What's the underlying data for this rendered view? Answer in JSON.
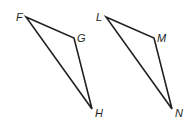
{
  "diagram": {
    "type": "geometry-triangles",
    "stroke_color": "#231f20",
    "background": "#ffffff",
    "triangles": [
      {
        "name": "FGH",
        "vertices": [
          {
            "label": "F",
            "x": 26,
            "y": 17,
            "lx": 16,
            "ly": 21
          },
          {
            "label": "G",
            "x": 74,
            "y": 38,
            "lx": 77,
            "ly": 42
          },
          {
            "label": "H",
            "x": 92,
            "y": 109,
            "lx": 95,
            "ly": 117
          }
        ]
      },
      {
        "name": "LMN",
        "vertices": [
          {
            "label": "L",
            "x": 106,
            "y": 17,
            "lx": 96,
            "ly": 21
          },
          {
            "label": "M",
            "x": 154,
            "y": 38,
            "lx": 157,
            "ly": 42
          },
          {
            "label": "N",
            "x": 172,
            "y": 109,
            "lx": 175,
            "ly": 117
          }
        ]
      }
    ]
  }
}
